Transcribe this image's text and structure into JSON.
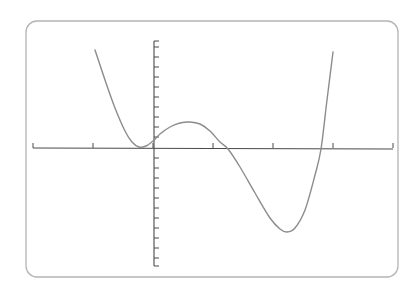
{
  "chart_data": {
    "type": "line",
    "title": "",
    "xlabel": "",
    "ylabel": "",
    "grid": false,
    "legend": null,
    "x_ticks_count": 7,
    "y_ticks_above_axis": 10,
    "y_ticks_below_axis": 11,
    "series": [
      {
        "name": "polynomial",
        "description": "Quartic-like curve: descends from top-left, shallow local min just left of the y-axis near the x-axis, rises to a small local max right of the y-axis, drops to a deep minimum, then rises steeply at the right.",
        "points_px": [
          [
            95,
            50
          ],
          [
            105,
            80
          ],
          [
            115,
            108
          ],
          [
            125,
            131
          ],
          [
            132,
            142
          ],
          [
            139,
            147
          ],
          [
            146,
            146
          ],
          [
            153,
            141
          ],
          [
            160,
            134
          ],
          [
            170,
            127
          ],
          [
            180,
            123
          ],
          [
            190,
            122
          ],
          [
            200,
            124
          ],
          [
            210,
            131
          ],
          [
            220,
            142
          ],
          [
            228,
            149
          ],
          [
            240,
            167
          ],
          [
            255,
            193
          ],
          [
            270,
            218
          ],
          [
            280,
            229
          ],
          [
            287,
            232
          ],
          [
            295,
            228
          ],
          [
            305,
            210
          ],
          [
            315,
            175
          ],
          [
            321,
            149
          ],
          [
            327,
            100
          ],
          [
            333,
            52
          ]
        ]
      }
    ],
    "colors": {
      "curve": "#8c8c8c",
      "axes": "#4a4a4a",
      "frame": "#b4b4b4"
    }
  }
}
